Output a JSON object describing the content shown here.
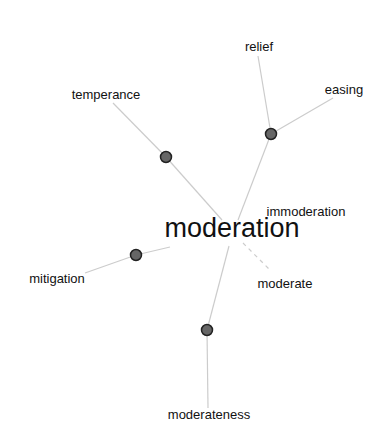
{
  "graph": {
    "center": {
      "label": "moderation",
      "x": 232,
      "y": 228
    },
    "nodes": [
      {
        "id": "n1",
        "x": 166,
        "y": 157
      },
      {
        "id": "n2",
        "x": 271,
        "y": 134
      },
      {
        "id": "n3",
        "x": 136,
        "y": 255
      },
      {
        "id": "n4",
        "x": 207,
        "y": 330
      }
    ],
    "labels": [
      {
        "text": "relief",
        "x": 259,
        "y": 46
      },
      {
        "text": "easing",
        "x": 344,
        "y": 89
      },
      {
        "text": "temperance",
        "x": 106,
        "y": 94
      },
      {
        "text": "immoderation",
        "x": 306,
        "y": 211
      },
      {
        "text": "mitigation",
        "x": 57,
        "y": 278
      },
      {
        "text": "moderate",
        "x": 285,
        "y": 283
      },
      {
        "text": "moderateness",
        "x": 209,
        "y": 414
      }
    ],
    "colors": {
      "node_fill": "#666666",
      "node_stroke": "#222222",
      "edge": "#cccccc"
    }
  }
}
